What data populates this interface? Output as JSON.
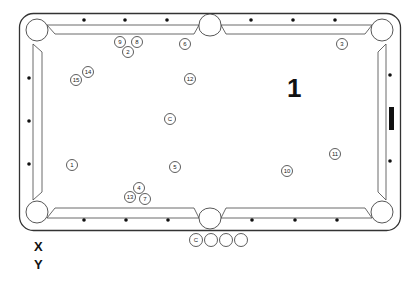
{
  "diagram": {
    "type": "billiards-table-layout",
    "shot_number": "1",
    "axis_labels": {
      "x": "X",
      "y": "Y"
    },
    "colors": {
      "line": "#333333",
      "background": "#ffffff",
      "marker": "#111111"
    },
    "balls": [
      {
        "label": "9",
        "x": 120,
        "y": 42
      },
      {
        "label": "8",
        "x": 137,
        "y": 42
      },
      {
        "label": "2",
        "x": 128,
        "y": 52
      },
      {
        "label": "6",
        "x": 185,
        "y": 44
      },
      {
        "label": "3",
        "x": 342,
        "y": 44
      },
      {
        "label": "14",
        "x": 88,
        "y": 72
      },
      {
        "label": "15",
        "x": 76,
        "y": 80
      },
      {
        "label": "12",
        "x": 190,
        "y": 79
      },
      {
        "label": "C",
        "x": 170,
        "y": 119
      },
      {
        "label": "1",
        "x": 72,
        "y": 165
      },
      {
        "label": "5",
        "x": 175,
        "y": 167
      },
      {
        "label": "11",
        "x": 335,
        "y": 154
      },
      {
        "label": "10",
        "x": 287,
        "y": 171
      },
      {
        "label": "4",
        "x": 139,
        "y": 188
      },
      {
        "label": "13",
        "x": 130,
        "y": 197
      },
      {
        "label": "7",
        "x": 145,
        "y": 199
      }
    ],
    "legend_balls": [
      {
        "label": "C",
        "x": 196,
        "y": 240
      },
      {
        "label": "",
        "x": 211,
        "y": 240
      },
      {
        "label": "",
        "x": 226,
        "y": 240
      },
      {
        "label": "",
        "x": 241,
        "y": 240
      }
    ],
    "diamonds": {
      "top": [
        84,
        125,
        167,
        251,
        293,
        335
      ],
      "bottom": [
        84,
        126,
        168,
        252,
        295,
        337
      ],
      "left": [
        78,
        121,
        164
      ],
      "right": [
        75,
        161
      ]
    },
    "head_string_marker": {
      "x": 389,
      "y": 107,
      "width": 5,
      "height": 23
    }
  }
}
